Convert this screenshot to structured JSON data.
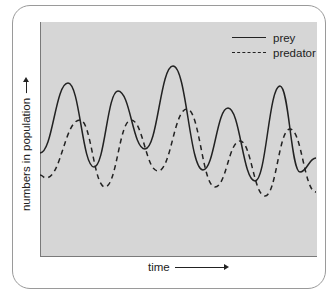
{
  "figure": {
    "y_axis_label": "numbers in population",
    "x_axis_label": "time",
    "legend": [
      {
        "label": "prey",
        "style": "solid"
      },
      {
        "label": "predator",
        "style": "dashed"
      }
    ],
    "colors": {
      "plot_background": "#d6d6d6",
      "line": "#222222",
      "card_border": "#9a9a9a"
    }
  },
  "chart_data": {
    "type": "line",
    "title": "",
    "xlabel": "time",
    "ylabel": "numbers in population",
    "axis_ticks": "none (arrows indicate increasing direction)",
    "grid": false,
    "legend_position": "top-right",
    "series": [
      {
        "name": "prey",
        "style": "solid",
        "points_px": [
          [
            40,
            153
          ],
          [
            68,
            83
          ],
          [
            94,
            167
          ],
          [
            118,
            91
          ],
          [
            145,
            149
          ],
          [
            173,
            66
          ],
          [
            203,
            170
          ],
          [
            228,
            108
          ],
          [
            255,
            181
          ],
          [
            280,
            86
          ],
          [
            300,
            172
          ],
          [
            316,
            158
          ]
        ]
      },
      {
        "name": "predator",
        "style": "dashed",
        "points_px": [
          [
            40,
            175
          ],
          [
            46,
            178
          ],
          [
            80,
            120
          ],
          [
            105,
            187
          ],
          [
            131,
            120
          ],
          [
            158,
            171
          ],
          [
            187,
            109
          ],
          [
            215,
            187
          ],
          [
            240,
            141
          ],
          [
            265,
            196
          ],
          [
            290,
            129
          ],
          [
            316,
            192
          ]
        ]
      }
    ]
  }
}
